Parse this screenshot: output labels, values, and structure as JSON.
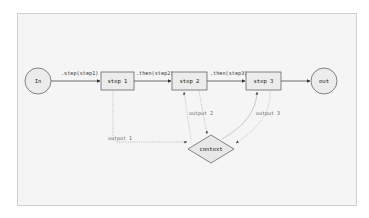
{
  "diagram": {
    "colors": {
      "frame_bg": "#f5f5f5",
      "frame_border": "#cfcfcf",
      "node_fill": "#ececec",
      "node_stroke": "#555555",
      "edge_solid": "#333333",
      "edge_dotted": "#999999"
    },
    "nodes": {
      "in": {
        "label": "In",
        "shape": "circle"
      },
      "step1": {
        "label": "step 1",
        "shape": "rect"
      },
      "step2": {
        "label": "step 2",
        "shape": "rect"
      },
      "step3": {
        "label": "step 3",
        "shape": "rect"
      },
      "out": {
        "label": "out",
        "shape": "circle"
      },
      "context": {
        "label": "context",
        "shape": "diamond"
      }
    },
    "edges": {
      "in_step1": {
        "label": ".step(step1)",
        "style": "solid"
      },
      "step1_step2": {
        "label": ".then(step2)",
        "style": "solid"
      },
      "step2_step3": {
        "label": ".then(step3)",
        "style": "solid"
      },
      "step3_out": {
        "label": "",
        "style": "solid"
      },
      "step1_context": {
        "label": "output 1",
        "style": "dotted"
      },
      "step2_context": {
        "label": "output 2",
        "style": "dotted"
      },
      "step3_context": {
        "label": "output 3",
        "style": "dotted"
      },
      "context_step2": {
        "label": "",
        "style": "dotted"
      },
      "context_step3": {
        "label": "",
        "style": "dotted"
      }
    }
  }
}
